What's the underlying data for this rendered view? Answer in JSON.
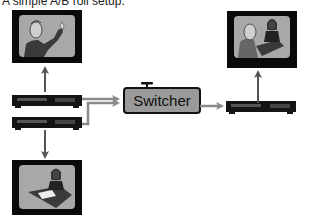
{
  "title": "A simple A/B roll setup.",
  "switcher": {
    "label": "Switcher"
  },
  "devices": {
    "vcr_a": {
      "role": "source-deck-a",
      "icon": "vcr-icon"
    },
    "vcr_b": {
      "role": "source-deck-b",
      "icon": "vcr-icon"
    },
    "vcr_record": {
      "role": "record-deck",
      "icon": "vcr-icon"
    }
  },
  "monitors": {
    "monitor_a": {
      "content": "man gesturing",
      "icon": "tv-monitor-icon"
    },
    "monitor_b": {
      "content": "woman writing at desk",
      "icon": "tv-monitor-icon"
    },
    "monitor_program": {
      "content": "man and woman combined",
      "icon": "tv-monitor-icon"
    }
  },
  "colors": {
    "arrow": "#8a8a8a",
    "arrow_dark": "#555555",
    "switcher_fill": "#9a9a9a",
    "monitor_frame": "#0a0a0a",
    "monitor_screen": "#a8a8a8",
    "vcr_body": "#141414"
  }
}
